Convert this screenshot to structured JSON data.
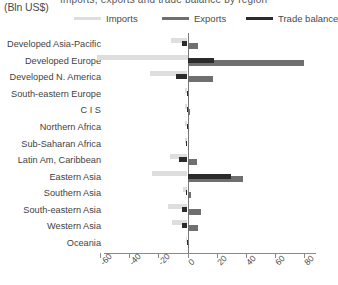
{
  "header": {
    "title_partial": "Imports, exports and trade balance by region",
    "units_label": "(Bln US$)"
  },
  "legend": {
    "position": "top",
    "items": [
      {
        "label": "Imports",
        "color": "#dedede",
        "key": "imports"
      },
      {
        "label": "Exports",
        "color": "#6f6f6f",
        "key": "exports"
      },
      {
        "label": "Trade balance",
        "color": "#2b2b2b",
        "key": "balance"
      }
    ]
  },
  "axis": {
    "ticks": [
      -60,
      -40,
      -20,
      0,
      20,
      40,
      60,
      80
    ],
    "tick_labels": [
      "-60",
      "-40",
      "-20",
      "0",
      "20",
      "40",
      "60",
      "80"
    ],
    "min": -68,
    "max": 86
  },
  "chart_data": {
    "type": "bar",
    "orientation": "horizontal",
    "title": "Imports, exports and trade balance by region",
    "xlabel": "(Bln US$)",
    "ylabel": "",
    "xlim": [
      -68,
      86
    ],
    "grid": false,
    "legend_position": "top",
    "categories": [
      "Developed Asia-Pacific",
      "Developed Europe",
      "Developed N. America",
      "South-eastern Europe",
      "C I S",
      "Northern Africa",
      "Sub-Saharan Africa",
      "Latin Am, Caribbean",
      "Eastern Asia",
      "Southern Asia",
      "South-eastern Asia",
      "Western Asia",
      "Oceania"
    ],
    "series": [
      {
        "name": "Imports",
        "color": "#dedede",
        "values": [
          -11.0,
          -62.0,
          -25.5,
          -1.6,
          -2.0,
          -1.4,
          -1.8,
          -12.0,
          -24.5,
          -3.0,
          -13.5,
          -10.5,
          -1.2
        ]
      },
      {
        "name": "Exports",
        "color": "#6f6f6f",
        "values": [
          7.0,
          80.0,
          17.5,
          1.2,
          1.6,
          1.0,
          1.2,
          6.5,
          38.0,
          2.4,
          9.5,
          7.0,
          0.8
        ]
      },
      {
        "name": "Trade balance",
        "color": "#2b2b2b",
        "values": [
          -4.0,
          18.0,
          -8.0,
          -0.5,
          -0.5,
          -0.5,
          -0.7,
          -5.5,
          30.0,
          -0.7,
          -4.0,
          -3.5,
          -0.4
        ]
      }
    ]
  }
}
